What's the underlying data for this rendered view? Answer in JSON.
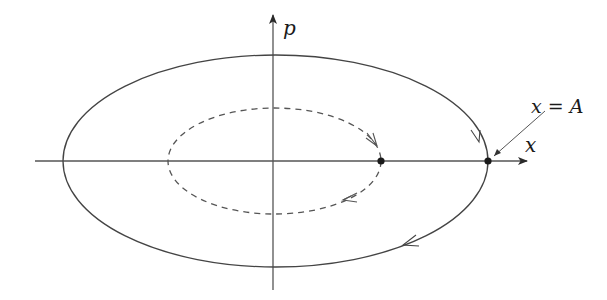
{
  "diagram": {
    "type": "phase-space",
    "axes": {
      "x_label": "x",
      "y_label": "p"
    },
    "annotation": {
      "text": "x = A"
    },
    "curves": [
      {
        "name": "outer-orbit",
        "style": "solid",
        "direction": "clockwise"
      },
      {
        "name": "inner-orbit",
        "style": "dashed",
        "direction": "clockwise"
      }
    ],
    "points": [
      {
        "name": "inner-turning-point"
      },
      {
        "name": "outer-turning-point"
      }
    ],
    "colors": {
      "stroke": "#3a3a3a",
      "text": "#1a1a1a",
      "background": "#ffffff"
    }
  }
}
